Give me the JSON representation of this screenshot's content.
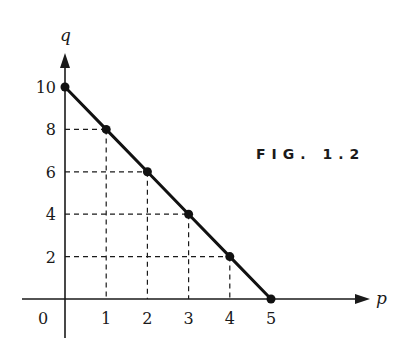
{
  "figure": {
    "caption": "FIG. 1.2"
  },
  "chart_data": {
    "type": "line",
    "title": "FIG. 1.2",
    "xlabel": "p",
    "ylabel": "q",
    "x": [
      0,
      1,
      2,
      3,
      4,
      5
    ],
    "values": [
      10,
      8,
      6,
      4,
      2,
      0
    ],
    "series": [
      {
        "name": "q = 10 - 2p",
        "x": [
          0,
          1,
          2,
          3,
          4,
          5
        ],
        "values": [
          10,
          8,
          6,
          4,
          2,
          0
        ]
      }
    ],
    "xticks": [
      "0",
      "1",
      "2",
      "3",
      "4",
      "5"
    ],
    "yticks": [
      "2",
      "4",
      "6",
      "8",
      "10"
    ],
    "xlim": [
      0,
      5
    ],
    "ylim": [
      0,
      10
    ],
    "grid": false,
    "guides": "dashed projection lines from each interior point to both axes",
    "markers": "filled circles",
    "legend": "none"
  }
}
